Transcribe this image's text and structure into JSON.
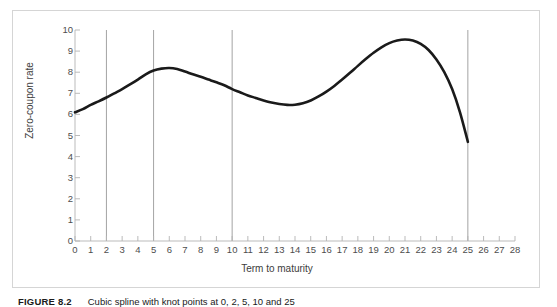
{
  "figure": {
    "caption_label": "FIGURE 8.2",
    "caption_text": "Cubic spline with knot points at 0, 2, 5, 10 and 25",
    "frame_color": "#d5d5d5",
    "background": "#ffffff"
  },
  "chart_data": {
    "type": "line",
    "title": "",
    "xlabel": "Term to maturity",
    "ylabel": "Zero-coupon rate",
    "xlim": [
      0,
      28
    ],
    "ylim": [
      0,
      10
    ],
    "grid": false,
    "legend": null,
    "axis_color": "#b3b3b3",
    "line_color": "#1a1a1a",
    "line_width": 2.6,
    "knot_line_color": "#9a9a9a",
    "xticks": [
      0,
      1,
      2,
      3,
      4,
      5,
      6,
      7,
      8,
      9,
      10,
      11,
      12,
      13,
      14,
      15,
      16,
      17,
      18,
      19,
      20,
      21,
      22,
      23,
      24,
      25,
      26,
      27,
      28
    ],
    "xtick_labels": [
      "0",
      "1",
      "2",
      "3",
      "4",
      "5",
      "6",
      "7",
      "8",
      "9",
      "10",
      "11",
      "12",
      "13",
      "14",
      "15",
      "16",
      "17",
      "18",
      "19",
      "20",
      "21",
      "22",
      "23",
      "24",
      "25",
      "26",
      "27",
      "28"
    ],
    "yticks": [
      0,
      1,
      2,
      3,
      4,
      5,
      6,
      7,
      8,
      9,
      10
    ],
    "ytick_labels": [
      "0",
      "1",
      "2",
      "3",
      "4",
      "5",
      "6",
      "7",
      "8",
      "9",
      "10"
    ],
    "knot_points": [
      0,
      2,
      5,
      10,
      25
    ],
    "knot_lines_drawn": [
      2,
      5,
      10,
      25
    ],
    "series": [
      {
        "name": "Zero-coupon rate",
        "x": [
          0,
          0.5,
          1,
          1.5,
          2,
          2.5,
          3,
          3.5,
          4,
          4.5,
          5,
          5.5,
          6,
          6.5,
          7,
          7.5,
          8,
          8.5,
          9,
          9.5,
          10,
          10.5,
          11,
          11.5,
          12,
          12.5,
          13,
          13.5,
          14,
          14.5,
          15,
          15.5,
          16,
          16.5,
          17,
          17.5,
          18,
          18.5,
          19,
          19.5,
          20,
          20.5,
          21,
          21.5,
          22,
          22.5,
          23,
          23.5,
          24,
          24.5,
          25
        ],
        "y": [
          6.1,
          6.25,
          6.45,
          6.62,
          6.8,
          7.0,
          7.2,
          7.42,
          7.65,
          7.9,
          8.08,
          8.17,
          8.2,
          8.15,
          8.03,
          7.9,
          7.78,
          7.65,
          7.52,
          7.38,
          7.2,
          7.05,
          6.9,
          6.78,
          6.66,
          6.56,
          6.49,
          6.45,
          6.46,
          6.53,
          6.66,
          6.85,
          7.08,
          7.35,
          7.65,
          7.97,
          8.3,
          8.62,
          8.92,
          9.18,
          9.38,
          9.5,
          9.55,
          9.5,
          9.34,
          9.05,
          8.6,
          8.0,
          7.2,
          6.1,
          4.7
        ]
      }
    ],
    "annotations": {
      "start_point": {
        "x": 0,
        "y": 6.1
      },
      "first_local_max": {
        "x": 6,
        "y": 8.2
      },
      "local_min": {
        "x": 13.5,
        "y": 6.45
      },
      "global_max": {
        "x": 21,
        "y": 9.55
      },
      "end_point": {
        "x": 25,
        "y": 4.7
      }
    }
  }
}
